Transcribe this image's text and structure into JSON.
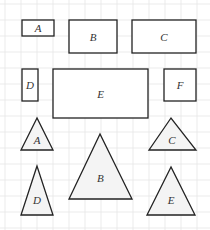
{
  "colors": {
    "grid": "#e6e6e6",
    "stroke": "#222222",
    "rect_fill": "#ffffff",
    "triangle_fill": "#f4f4f4",
    "label": "#333333"
  },
  "rectangles": [
    {
      "label": "A",
      "x": 22,
      "y": 20,
      "w": 32,
      "h": 16
    },
    {
      "label": "B",
      "x": 69,
      "y": 20,
      "w": 48,
      "h": 33
    },
    {
      "label": "C",
      "x": 132,
      "y": 20,
      "w": 64,
      "h": 33
    },
    {
      "label": "D",
      "x": 22,
      "y": 69,
      "w": 16,
      "h": 32
    },
    {
      "label": "E",
      "x": 53,
      "y": 69,
      "w": 95,
      "h": 49
    },
    {
      "label": "F",
      "x": 164,
      "y": 69,
      "w": 32,
      "h": 32
    }
  ],
  "triangles": [
    {
      "label": "A",
      "apex": [
        37,
        118
      ],
      "left": [
        21,
        150
      ],
      "right": [
        53,
        150
      ]
    },
    {
      "label": "B",
      "apex": [
        100,
        134
      ],
      "left": [
        69,
        199
      ],
      "right": [
        132,
        199
      ]
    },
    {
      "label": "C",
      "apex": [
        171,
        118
      ],
      "left": [
        149,
        150
      ],
      "right": [
        196,
        150
      ]
    },
    {
      "label": "D",
      "apex": [
        37,
        166
      ],
      "left": [
        21,
        215
      ],
      "right": [
        53,
        215
      ]
    },
    {
      "label": "E",
      "apex": [
        171,
        167
      ],
      "left": [
        147,
        215
      ],
      "right": [
        195,
        215
      ]
    }
  ]
}
